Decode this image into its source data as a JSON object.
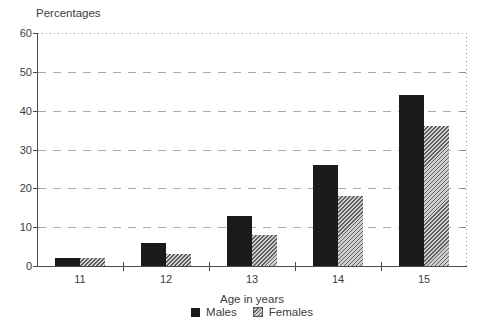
{
  "chart_data": {
    "type": "bar",
    "title": "Percentages",
    "xlabel": "Age in years",
    "ylabel": "Percentages",
    "categories": [
      "11",
      "12",
      "13",
      "14",
      "15"
    ],
    "series": [
      {
        "name": "Males",
        "values": [
          2,
          6,
          13,
          26,
          44
        ],
        "color": "#1b1b1b",
        "pattern": "solid"
      },
      {
        "name": "Females",
        "values": [
          2,
          3,
          8,
          18,
          36
        ],
        "color": "#a0a0a0",
        "pattern": "diagonal-hatch"
      }
    ],
    "ylim": [
      0,
      60
    ],
    "y_ticks": [
      0,
      10,
      20,
      30,
      40,
      50,
      60
    ],
    "grid": "horizontal-dashed",
    "top_gridline_style": "dotted",
    "legend_position": "bottom"
  },
  "colors": {
    "background": "#ffffff",
    "axis": "#4a4a4a",
    "gridline": "#aaaaaa",
    "text": "#3c3c3c",
    "males_bar": "#1b1b1b",
    "females_bar_lines": "#5f5f5f",
    "females_bar_fill": "#cfcfcf"
  }
}
